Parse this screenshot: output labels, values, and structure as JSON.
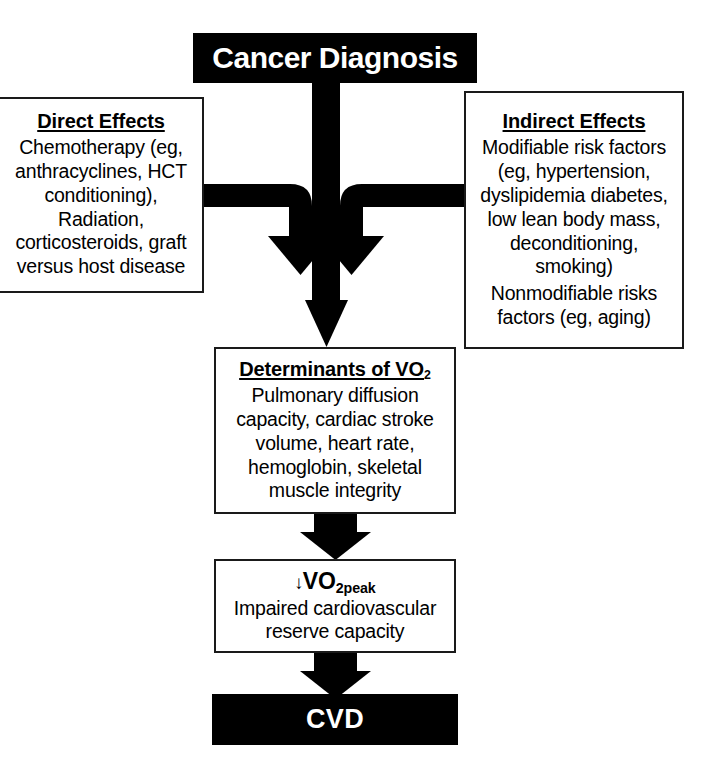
{
  "figure": {
    "type": "flowchart",
    "orientation": "top-to-bottom",
    "background_color": "#ffffff",
    "ink_color": "#000000"
  },
  "nodes": {
    "cancer_diagnosis": {
      "title": "Cancer Diagnosis",
      "style": "filled-black"
    },
    "direct_effects": {
      "title": "Direct Effects",
      "body": "Chemotherapy (eg, anthracyclines, HCT conditioning), Radiation, corticosteroids, graft versus host disease",
      "style": "outlined"
    },
    "indirect_effects": {
      "title": "Indirect Effects",
      "body_1": "Modifiable risk factors (eg, hypertension, dyslipidemia diabetes, low lean body mass, deconditioning, smoking)",
      "body_2": "Nonmodifiable risks factors (eg, aging)",
      "style": "outlined"
    },
    "determinants": {
      "title_main": "Determinants of VO",
      "title_sub": "2",
      "body": "Pulmonary diffusion capacity, cardiac stroke volume, heart rate, hemoglobin, skeletal muscle integrity",
      "style": "outlined"
    },
    "vo2peak": {
      "title_arrow": "↓",
      "title_main": "VO",
      "title_sub": "2peak",
      "body": "Impaired cardiovascular reserve capacity",
      "style": "outlined"
    },
    "cvd": {
      "title": "CVD",
      "style": "filled-black"
    }
  },
  "connectors": [
    {
      "name": "cancer-diagnosis-to-determinants",
      "from": "cancer_diagnosis",
      "to": "determinants",
      "shape": "straight-vertical-arrow"
    },
    {
      "name": "direct-effects-to-determinants",
      "from": "direct_effects",
      "to": "determinants",
      "shape": "elbow-right-then-down-arrow"
    },
    {
      "name": "indirect-effects-to-determinants",
      "from": "indirect_effects",
      "to": "determinants",
      "shape": "elbow-left-then-down-arrow"
    },
    {
      "name": "determinants-to-vo2peak",
      "from": "determinants",
      "to": "vo2peak",
      "shape": "straight-vertical-arrow"
    },
    {
      "name": "vo2peak-to-cvd",
      "from": "vo2peak",
      "to": "cvd",
      "shape": "straight-vertical-arrow"
    }
  ]
}
